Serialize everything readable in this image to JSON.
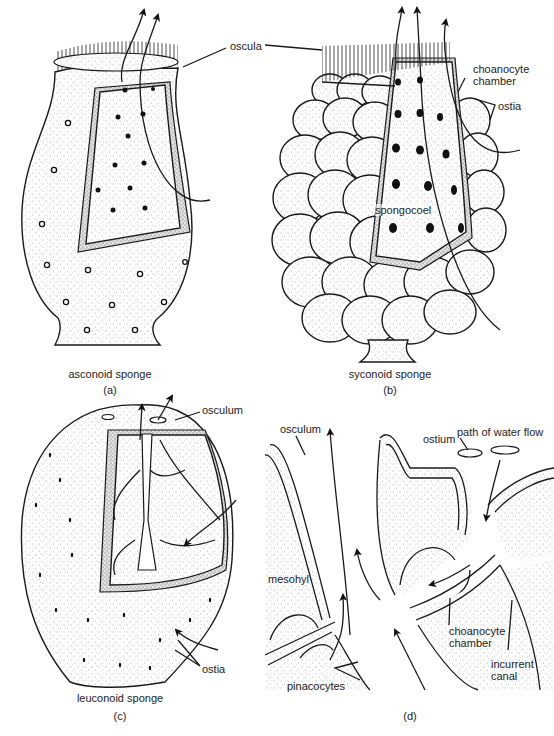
{
  "figure": {
    "panels": [
      {
        "id": "a",
        "caption_label": "(a)",
        "title": "asconoid sponge",
        "labels": [
          "oscula"
        ]
      },
      {
        "id": "b",
        "caption_label": "(b)",
        "title": "syconoid sponge",
        "labels": [
          "choanocyte chamber",
          "ostia",
          "spongocoel"
        ]
      },
      {
        "id": "c",
        "caption_label": "(c)",
        "title": "leuconoid sponge",
        "labels": [
          "osculum",
          "ostia"
        ]
      },
      {
        "id": "d",
        "caption_label": "(d)",
        "title": "",
        "labels": [
          "osculum",
          "path of water flow",
          "ostium",
          "mesohyl",
          "choanocyte chamber",
          "incurrent canal",
          "pinacocytes"
        ]
      }
    ]
  },
  "labels": {
    "oscula": "oscula",
    "choanocyte_chamber_b_1": "choanocyte",
    "choanocyte_chamber_b_2": "chamber",
    "ostia_b": "ostia",
    "spongocoel": "spongocoel",
    "osculum_c": "osculum",
    "ostia_c": "ostia",
    "osculum_d": "osculum",
    "path_of_water_flow": "path of water flow",
    "ostium": "ostium",
    "mesohyl": "mesohyl",
    "choanocyte_chamber_d_1": "choanocyte",
    "choanocyte_chamber_d_2": "chamber",
    "incurrent_canal_1": "incurrent",
    "incurrent_canal_2": "canal",
    "pinacocytes": "pinacocytes"
  },
  "captions": {
    "a_title": "asconoid sponge",
    "a_letter": "(a)",
    "b_title": "syconoid sponge",
    "b_letter": "(b)",
    "c_title": "leuconoid sponge",
    "c_letter": "(c)",
    "d_letter": "(d)"
  }
}
